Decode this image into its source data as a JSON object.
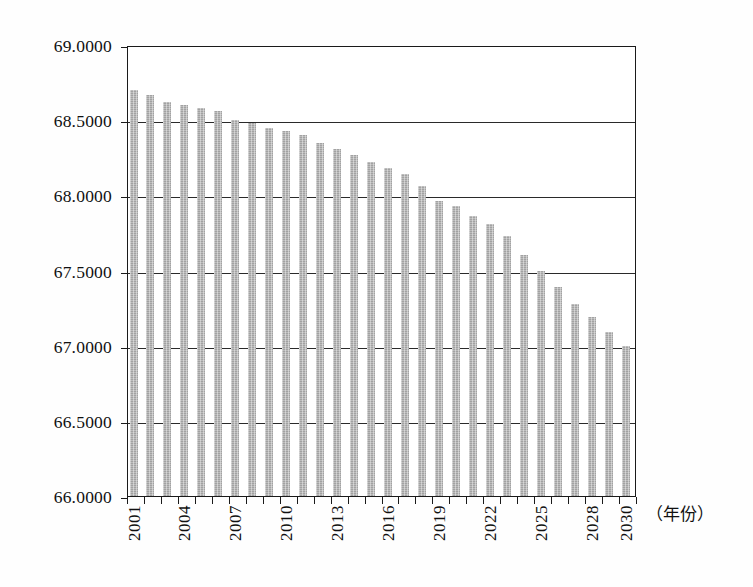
{
  "chart_data": {
    "type": "bar",
    "title": "",
    "subtitle": "",
    "xlabel": "（年份）",
    "ylabel": "",
    "grid": true,
    "legend": null,
    "ylim": [
      66.0,
      69.0
    ],
    "y_ticks": [
      "66.0000",
      "66.5000",
      "67.0000",
      "67.5000",
      "68.0000",
      "68.5000",
      "69.0000"
    ],
    "y_tick_values": [
      66.0,
      66.5,
      67.0,
      67.5,
      68.0,
      68.5,
      69.0
    ],
    "x_tick_labels": [
      "2001",
      "2004",
      "2007",
      "2010",
      "2013",
      "2016",
      "2019",
      "2022",
      "2025",
      "2028",
      "2030"
    ],
    "bar_color": "#b0b0b0",
    "axis_color": "#1a1a1a",
    "categories": [
      "2001",
      "2002",
      "2003",
      "2004",
      "2005",
      "2006",
      "2007",
      "2008",
      "2009",
      "2010",
      "2011",
      "2012",
      "2013",
      "2014",
      "2015",
      "2016",
      "2017",
      "2018",
      "2019",
      "2020",
      "2021",
      "2022",
      "2023",
      "2024",
      "2025",
      "2026",
      "2027",
      "2028",
      "2029",
      "2030"
    ],
    "values": [
      68.7,
      68.67,
      68.62,
      68.6,
      68.58,
      68.56,
      68.5,
      68.48,
      68.45,
      68.43,
      68.4,
      68.35,
      68.31,
      68.27,
      68.22,
      68.18,
      68.14,
      68.06,
      67.96,
      67.93,
      67.86,
      67.81,
      67.73,
      67.6,
      67.5,
      67.39,
      67.28,
      67.19,
      67.09,
      67.0
    ]
  },
  "axis_unit_note": "（年份）"
}
